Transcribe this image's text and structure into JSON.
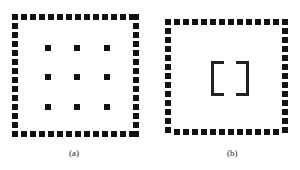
{
  "panels": [
    {
      "id": "a",
      "caption": "(a)",
      "content": "3x3 grid of square dots inside a dashed square frame"
    },
    {
      "id": "b",
      "caption": "(b)",
      "content": "pair of square brackets [ ] inside a dashed square frame"
    }
  ],
  "colors": {
    "ink": "#111111",
    "background": "#ffffff"
  }
}
